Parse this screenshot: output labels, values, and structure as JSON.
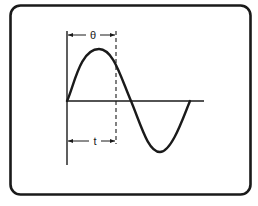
{
  "diagram": {
    "type": "sine-wave-phase-diagram",
    "labels": {
      "theta": "θ",
      "time": "t"
    },
    "colors": {
      "stroke": "#1a1a1a",
      "background": "#ffffff"
    },
    "elements": [
      "rounded-frame",
      "vertical-axis",
      "horizontal-axis",
      "sine-wave (one full cycle)",
      "dashed-reference-line",
      "theta-dimension-arrow",
      "t-dimension-arrow"
    ]
  }
}
